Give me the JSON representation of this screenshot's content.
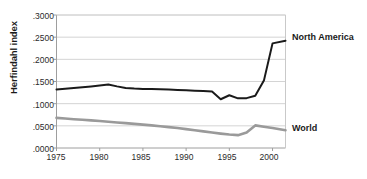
{
  "chart_data": {
    "type": "line",
    "title": "",
    "xlabel": "",
    "ylabel": "Herfindahl index",
    "xlim": [
      1975,
      2001.5
    ],
    "ylim": [
      0.0,
      0.3
    ],
    "grid": true,
    "legend_position": "right-inline",
    "y_tick_labels": [
      ".3000",
      ".2500",
      ".2000",
      ".1500",
      ".1000",
      ".0500",
      ".0000"
    ],
    "y_tick_values": [
      0.3,
      0.25,
      0.2,
      0.15,
      0.1,
      0.05,
      0.0
    ],
    "x_tick_labels": [
      "1975",
      "1980",
      "1985",
      "1990",
      "1995",
      "2000"
    ],
    "x_tick_values": [
      1975,
      1980,
      1985,
      1990,
      1995,
      2000
    ],
    "series": [
      {
        "name": "North America",
        "color": "#1a1a1a",
        "width": 2.0,
        "x": [
          1975,
          1976,
          1977,
          1978,
          1979,
          1980,
          1981,
          1982,
          1983,
          1984,
          1985,
          1986,
          1987,
          1988,
          1989,
          1990,
          1991,
          1992,
          1993,
          1994,
          1995,
          1996,
          1997,
          1998,
          1999,
          2000,
          2001.5
        ],
        "values": [
          0.132,
          0.1338,
          0.1355,
          0.1372,
          0.139,
          0.141,
          0.1432,
          0.139,
          0.1355,
          0.134,
          0.1333,
          0.133,
          0.1325,
          0.1318,
          0.131,
          0.13,
          0.1292,
          0.1285,
          0.1272,
          0.11,
          0.119,
          0.112,
          0.1125,
          0.118,
          0.152,
          0.236,
          0.242
        ]
      },
      {
        "name": "World",
        "color": "#9a9a9a",
        "width": 2.6,
        "x": [
          1975,
          1976,
          1977,
          1978,
          1979,
          1980,
          1981,
          1982,
          1983,
          1984,
          1985,
          1986,
          1987,
          1988,
          1989,
          1990,
          1991,
          1992,
          1993,
          1994,
          1995,
          1996,
          1997,
          1998,
          1999,
          2000,
          2001.5
        ],
        "values": [
          0.068,
          0.0665,
          0.065,
          0.0636,
          0.0622,
          0.0608,
          0.0592,
          0.0576,
          0.056,
          0.0544,
          0.0528,
          0.051,
          0.049,
          0.047,
          0.045,
          0.0425,
          0.04,
          0.0375,
          0.0348,
          0.0325,
          0.0305,
          0.029,
          0.035,
          0.051,
          0.0478,
          0.045,
          0.04
        ]
      }
    ]
  },
  "axis": {
    "y_title": "Herfindahl index"
  },
  "labels": {
    "north_america": "North America",
    "world": "World"
  }
}
